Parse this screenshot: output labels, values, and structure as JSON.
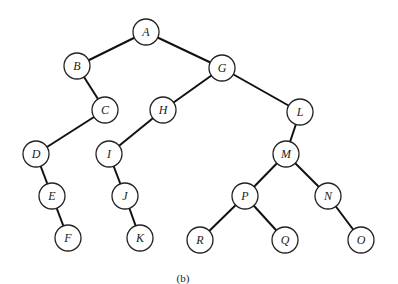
{
  "diagram": {
    "type": "binary-tree",
    "caption": "(b)",
    "node_radius": 13,
    "nodes": [
      {
        "id": "A",
        "label": "A",
        "x": 146,
        "y": 32
      },
      {
        "id": "B",
        "label": "B",
        "x": 77,
        "y": 66
      },
      {
        "id": "G",
        "label": "G",
        "x": 222,
        "y": 68
      },
      {
        "id": "C",
        "label": "C",
        "x": 105,
        "y": 110
      },
      {
        "id": "H",
        "label": "H",
        "x": 163,
        "y": 110
      },
      {
        "id": "L",
        "label": "L",
        "x": 300,
        "y": 112
      },
      {
        "id": "D",
        "label": "D",
        "x": 36,
        "y": 154
      },
      {
        "id": "I",
        "label": "I",
        "x": 109,
        "y": 154
      },
      {
        "id": "M",
        "label": "M",
        "x": 286,
        "y": 154
      },
      {
        "id": "E",
        "label": "E",
        "x": 52,
        "y": 196
      },
      {
        "id": "J",
        "label": "J",
        "x": 125,
        "y": 196
      },
      {
        "id": "P",
        "label": "P",
        "x": 245,
        "y": 196
      },
      {
        "id": "N",
        "label": "N",
        "x": 328,
        "y": 196
      },
      {
        "id": "F",
        "label": "F",
        "x": 68,
        "y": 238
      },
      {
        "id": "K",
        "label": "K",
        "x": 140,
        "y": 238
      },
      {
        "id": "R",
        "label": "R",
        "x": 200,
        "y": 240
      },
      {
        "id": "Q",
        "label": "Q",
        "x": 285,
        "y": 240
      },
      {
        "id": "O",
        "label": "O",
        "x": 361,
        "y": 240
      }
    ],
    "edges": [
      [
        "A",
        "B"
      ],
      [
        "A",
        "G"
      ],
      [
        "B",
        "C"
      ],
      [
        "C",
        "D"
      ],
      [
        "D",
        "E"
      ],
      [
        "E",
        "F"
      ],
      [
        "G",
        "H"
      ],
      [
        "G",
        "L"
      ],
      [
        "H",
        "I"
      ],
      [
        "I",
        "J"
      ],
      [
        "J",
        "K"
      ],
      [
        "L",
        "M"
      ],
      [
        "M",
        "P"
      ],
      [
        "M",
        "N"
      ],
      [
        "P",
        "R"
      ],
      [
        "P",
        "Q"
      ],
      [
        "N",
        "O"
      ]
    ]
  }
}
